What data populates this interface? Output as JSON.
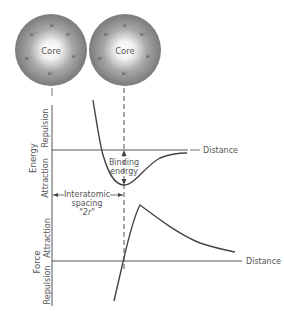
{
  "atoms": [
    {
      "label": "Core",
      "electron_symbol": "e⁻"
    },
    {
      "label": "Core",
      "electron_symbol": "e⁻"
    }
  ],
  "energy_plot": {
    "axis_label": "Energy",
    "upper_region_label": "Repulsion",
    "lower_region_label": "Attraction",
    "x_label": "Distance",
    "annotation_binding_line1": "Binding",
    "annotation_binding_line2": "energy",
    "annotation_spacing_line1": "Interatomic",
    "annotation_spacing_line2": "spacing",
    "annotation_spacing_line3": "\"2r\""
  },
  "force_plot": {
    "axis_label": "Force",
    "upper_region_label": "Attraction",
    "lower_region_label": "Repulsion",
    "x_label": "Distance"
  },
  "colors": {
    "line": "#555555",
    "sphere_dark": "#7a7a7a",
    "sphere_light": "#ffffff"
  }
}
